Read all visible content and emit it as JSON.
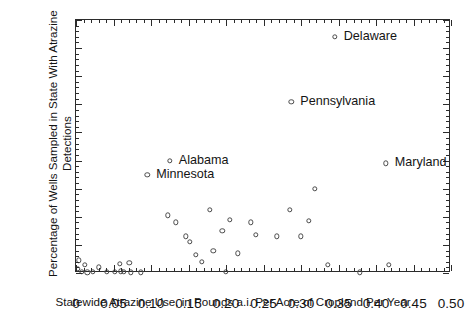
{
  "chart_data": {
    "type": "scatter",
    "title": "",
    "xlabel": "Statewide Atrazine Use, in Pounds a.i. Per Acre of Cropland Per Year",
    "ylabel": "Percentage of Wells Sampled in State With Atrazine Detections",
    "xlim": [
      0,
      0.5
    ],
    "ylim": [
      0,
      90
    ],
    "xticks": [
      0,
      0.05,
      0.1,
      0.15,
      0.2,
      0.25,
      0.3,
      0.35,
      0.4,
      0.45,
      0.5
    ],
    "xticklabels": [
      "0",
      "0.05",
      "0.10",
      "0.15",
      "0.20",
      "0.25",
      "0.30",
      "0.35",
      "0.40",
      "0.45",
      "0.50"
    ],
    "yticks": [
      0,
      10,
      20,
      30,
      40,
      50,
      60,
      70,
      80,
      90
    ],
    "yticklabels": [
      "0",
      "10",
      "20",
      "30",
      "40",
      "50",
      "60",
      "70",
      "80",
      "90"
    ],
    "x_minor_interval": 0.01,
    "y_minor_interval": 2,
    "grid": false,
    "legend": null,
    "marker": "open-circle",
    "marker_color": "#4a4a4a",
    "points": [
      {
        "x": 0.002,
        "y": 1.5,
        "label": null
      },
      {
        "x": 0.004,
        "y": 4.5,
        "label": null
      },
      {
        "x": 0.008,
        "y": 0.4,
        "label": null
      },
      {
        "x": 0.012,
        "y": 3.0,
        "label": null
      },
      {
        "x": 0.015,
        "y": 0.3,
        "label": null
      },
      {
        "x": 0.022,
        "y": 0.5,
        "label": null
      },
      {
        "x": 0.03,
        "y": 2.0,
        "label": null
      },
      {
        "x": 0.041,
        "y": 0.4,
        "label": null
      },
      {
        "x": 0.052,
        "y": 0.5,
        "label": null
      },
      {
        "x": 0.058,
        "y": 3.2,
        "label": null
      },
      {
        "x": 0.06,
        "y": 0.6,
        "label": null
      },
      {
        "x": 0.064,
        "y": 0.4,
        "label": null
      },
      {
        "x": 0.071,
        "y": 3.6,
        "label": null
      },
      {
        "x": 0.073,
        "y": 0.3,
        "label": null
      },
      {
        "x": 0.086,
        "y": 0.3,
        "label": null
      },
      {
        "x": 0.095,
        "y": 35.0,
        "label": "Minnesota"
      },
      {
        "x": 0.122,
        "y": 20.5,
        "label": null
      },
      {
        "x": 0.125,
        "y": 40.0,
        "label": "Alabama"
      },
      {
        "x": 0.133,
        "y": 18.0,
        "label": null
      },
      {
        "x": 0.146,
        "y": 13.0,
        "label": null
      },
      {
        "x": 0.152,
        "y": 11.0,
        "label": null
      },
      {
        "x": 0.16,
        "y": 6.5,
        "label": null
      },
      {
        "x": 0.168,
        "y": 4.0,
        "label": null
      },
      {
        "x": 0.178,
        "y": 22.5,
        "label": null
      },
      {
        "x": 0.183,
        "y": 8.0,
        "label": null
      },
      {
        "x": 0.195,
        "y": 15.0,
        "label": null
      },
      {
        "x": 0.2,
        "y": 0.4,
        "label": null
      },
      {
        "x": 0.205,
        "y": 19.0,
        "label": null
      },
      {
        "x": 0.216,
        "y": 7.0,
        "label": null
      },
      {
        "x": 0.233,
        "y": 18.0,
        "label": null
      },
      {
        "x": 0.24,
        "y": 13.5,
        "label": null
      },
      {
        "x": 0.268,
        "y": 13.0,
        "label": null
      },
      {
        "x": 0.285,
        "y": 22.5,
        "label": null
      },
      {
        "x": 0.287,
        "y": 61.0,
        "label": "Pennsylvania"
      },
      {
        "x": 0.3,
        "y": 13.0,
        "label": null
      },
      {
        "x": 0.31,
        "y": 18.5,
        "label": null
      },
      {
        "x": 0.318,
        "y": 30.0,
        "label": null
      },
      {
        "x": 0.336,
        "y": 3.0,
        "label": null
      },
      {
        "x": 0.345,
        "y": 84.0,
        "label": "Delaware"
      },
      {
        "x": 0.378,
        "y": 0.3,
        "label": null
      },
      {
        "x": 0.413,
        "y": 39.0,
        "label": "Maryland"
      },
      {
        "x": 0.417,
        "y": 3.0,
        "label": null
      }
    ],
    "annotations": [
      {
        "text": "Delaware",
        "anchor_x": 0.345,
        "anchor_y": 84.0,
        "dx": 9,
        "dy": 0,
        "align": "left"
      },
      {
        "text": "Pennsylvania",
        "anchor_x": 0.287,
        "anchor_y": 61.0,
        "dx": 9,
        "dy": 0,
        "align": "left"
      },
      {
        "text": "Maryland",
        "anchor_x": 0.413,
        "anchor_y": 39.0,
        "dx": 9,
        "dy": 0,
        "align": "left"
      },
      {
        "text": "Alabama",
        "anchor_x": 0.125,
        "anchor_y": 40.0,
        "dx": 9,
        "dy": 0,
        "align": "left"
      },
      {
        "text": "Minnesota",
        "anchor_x": 0.095,
        "anchor_y": 35.0,
        "dx": 9,
        "dy": 0,
        "align": "left"
      }
    ]
  }
}
